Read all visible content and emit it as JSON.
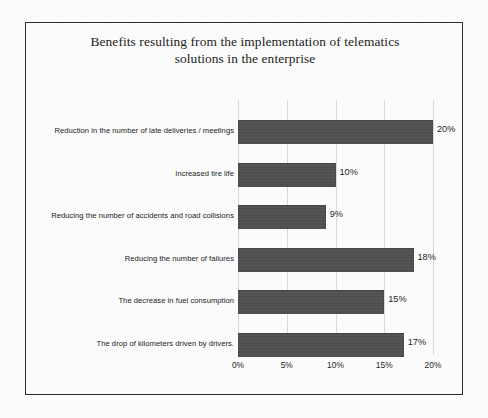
{
  "chart_data": {
    "type": "bar",
    "orientation": "horizontal",
    "title": "Benefits resulting from the implementation of telematics solutions in the enterprise",
    "title_lines": [
      "Benefits resulting from the implementation of telematics",
      "solutions in the enterprise"
    ],
    "categories": [
      "Reduction in the number of late deliveries / meetings",
      "Increased tire life",
      "Reducing the number of accidents and road collisions",
      "Reducing the number of failures",
      "The decrease in fuel consumption",
      "The drop of kilometers driven by drivers."
    ],
    "values": [
      20,
      10,
      9,
      18,
      15,
      17
    ],
    "data_labels": [
      "20%",
      "10%",
      "9%",
      "18%",
      "15%",
      "17%"
    ],
    "xlabel": "",
    "ylabel": "",
    "xlim": [
      0,
      20
    ],
    "xticks": [
      0,
      5,
      10,
      15,
      20
    ],
    "xtick_labels": [
      "0%",
      "5%",
      "10%",
      "15%",
      "20%"
    ],
    "grid": "vertical",
    "legend": "none",
    "bar_color": "#4d4d4d",
    "frame_color": "#2b2b2b",
    "gridline_color": "#d8d8d8",
    "background_color": "#fdfdfd"
  }
}
